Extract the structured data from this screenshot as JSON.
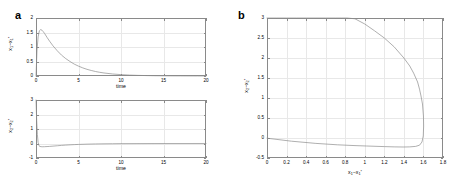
{
  "figure": {
    "panel_a_letter": "a",
    "panel_b_letter": "b"
  },
  "chart_data": [
    {
      "type": "line",
      "panel": "a",
      "subplot": "top",
      "title": "",
      "xlabel": "time",
      "ylabel": "x1-x1*",
      "xlim": [
        0,
        20
      ],
      "ylim": [
        0,
        2
      ],
      "xticks": [
        0,
        5,
        10,
        15,
        20
      ],
      "xticklabels": [
        "0",
        "5",
        "10",
        "15",
        "20"
      ],
      "yticks": [
        0,
        0.5,
        1,
        1.5,
        2
      ],
      "yticklabels": [
        "0",
        "0.5",
        "1",
        "1.5",
        "2"
      ],
      "grid": true,
      "legend": "none",
      "series": [
        {
          "name": "x1 error",
          "x": [
            0,
            0.12,
            0.25,
            0.4,
            0.55,
            0.7,
            0.85,
            1.0,
            1.3,
            1.6,
            2.0,
            2.5,
            3.0,
            3.5,
            4.0,
            4.5,
            5.0,
            5.5,
            6.0,
            6.5,
            7.0,
            7.5,
            8.0,
            9.0,
            10.0,
            11.0,
            12.0,
            13.0,
            14.0,
            15.0,
            16.0,
            17.0,
            18.0,
            19.0,
            20.0
          ],
          "y": [
            0.0,
            0.9,
            1.35,
            1.56,
            1.6,
            1.58,
            1.53,
            1.47,
            1.33,
            1.2,
            1.04,
            0.87,
            0.72,
            0.6,
            0.5,
            0.41,
            0.34,
            0.28,
            0.23,
            0.19,
            0.155,
            0.127,
            0.104,
            0.07,
            0.047,
            0.031,
            0.021,
            0.014,
            0.009,
            0.006,
            0.004,
            0.003,
            0.002,
            0.001,
            0.001
          ]
        }
      ]
    },
    {
      "type": "line",
      "panel": "a",
      "subplot": "bottom",
      "title": "",
      "xlabel": "time",
      "ylabel": "x2-x2*",
      "xlim": [
        0,
        20
      ],
      "ylim": [
        -1,
        3
      ],
      "xticks": [
        0,
        5,
        10,
        15,
        20
      ],
      "xticklabels": [
        "0",
        "5",
        "10",
        "15",
        "20"
      ],
      "yticks": [
        -1,
        0,
        1,
        2,
        3
      ],
      "yticklabels": [
        "-1",
        "0",
        "1",
        "2",
        "3"
      ],
      "grid": true,
      "legend": "none",
      "series": [
        {
          "name": "x2 error",
          "x": [
            0,
            0.08,
            0.16,
            0.25,
            0.35,
            0.45,
            0.6,
            0.8,
            1.0,
            1.3,
            1.6,
            2.0,
            2.5,
            3.0,
            3.5,
            4.0,
            4.5,
            5.0,
            6.0,
            7.0,
            8.0,
            9.0,
            10.0,
            12.0,
            14.0,
            16.0,
            18.0,
            20.0
          ],
          "y": [
            3.0,
            1.6,
            0.62,
            0.06,
            -0.15,
            -0.2,
            -0.22,
            -0.225,
            -0.22,
            -0.21,
            -0.2,
            -0.18,
            -0.155,
            -0.13,
            -0.11,
            -0.092,
            -0.077,
            -0.064,
            -0.045,
            -0.031,
            -0.022,
            -0.015,
            -0.01,
            -0.005,
            -0.002,
            -0.001,
            -0.001,
            0.0
          ]
        }
      ]
    },
    {
      "type": "line",
      "panel": "b",
      "title": "",
      "xlabel": "x1-x1*",
      "ylabel": "x2-x2*",
      "xlim": [
        0,
        1.8
      ],
      "ylim": [
        -0.5,
        3
      ],
      "xticks": [
        0,
        0.2,
        0.4,
        0.6,
        0.8,
        1,
        1.2,
        1.4,
        1.6,
        1.8
      ],
      "xticklabels": [
        "0",
        "0.2",
        "0.4",
        "0.6",
        "0.8",
        "1",
        "1.2",
        "1.4",
        "1.6",
        "1.8"
      ],
      "yticks": [
        -0.5,
        0,
        0.5,
        1,
        1.5,
        2,
        2.5,
        3
      ],
      "yticklabels": [
        "-0.5",
        "0",
        "0.5",
        "1",
        "1.5",
        "2",
        "2.5",
        "3"
      ],
      "grid": true,
      "legend": "none",
      "series": [
        {
          "name": "phase trajectory",
          "x": [
            0.0,
            0.25,
            0.5,
            0.72,
            0.9,
            1.02,
            1.2,
            1.3,
            1.4,
            1.46,
            1.52,
            1.56,
            1.585,
            1.598,
            1.602,
            1.6,
            1.59,
            1.575,
            1.56,
            1.54,
            1.5,
            1.46,
            1.4,
            1.3,
            1.2,
            1.1,
            1.0,
            0.9,
            0.82,
            0.76,
            0.7,
            0.6,
            0.5,
            0.4,
            0.3,
            0.2,
            0.1,
            0.0
          ],
          "y": [
            -0.005,
            -0.08,
            -0.135,
            -0.17,
            -0.19,
            -0.2,
            -0.215,
            -0.222,
            -0.225,
            -0.222,
            -0.21,
            -0.18,
            -0.1,
            0.05,
            0.3,
            0.55,
            0.85,
            1.05,
            1.22,
            1.4,
            1.62,
            1.8,
            2.0,
            2.28,
            2.5,
            2.68,
            2.85,
            2.98,
            3.0,
            3.0,
            3.0,
            3.0,
            3.0,
            3.0,
            3.0,
            3.0,
            3.0,
            3.0
          ]
        }
      ]
    }
  ]
}
